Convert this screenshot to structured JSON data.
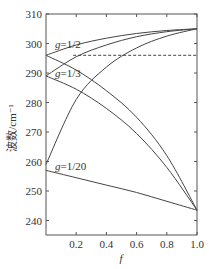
{
  "chart_data": {
    "type": "line",
    "title": "",
    "xlabel": "f",
    "ylabel": "波数/cm⁻¹",
    "xlim": [
      0,
      1.0
    ],
    "ylim": [
      234,
      310
    ],
    "x_ticks": [
      "0.2",
      "0.4",
      "0.6",
      "0.8",
      "1.0"
    ],
    "y_ticks": [
      "240",
      "250",
      "260",
      "270",
      "280",
      "290",
      "300",
      "310"
    ],
    "grid": false,
    "legend": "none",
    "annotations": [
      "g=1/2",
      "g=1/3",
      "g=1/20"
    ],
    "reference_line": {
      "style": "dashed",
      "y": 296,
      "x_range": [
        0.18,
        1.0
      ]
    },
    "x": [
      0,
      0.2,
      0.4,
      0.6,
      0.8,
      1.0
    ],
    "series": [
      {
        "name": "g=1/2 upper",
        "values": [
          296,
          299.5,
          301.8,
          303.4,
          304.4,
          305
        ]
      },
      {
        "name": "g=1/2 lower",
        "values": [
          296,
          291,
          284,
          275,
          262,
          243.5
        ]
      },
      {
        "name": "g=1/3 upper",
        "values": [
          289,
          295.5,
          299.5,
          302.3,
          304,
          305
        ]
      },
      {
        "name": "g=1/3 lower",
        "values": [
          289,
          284.5,
          278,
          269.5,
          258,
          243.5
        ]
      },
      {
        "name": "g=1/20 upper",
        "values": [
          259,
          281,
          292,
          298.5,
          302.5,
          305
        ]
      },
      {
        "name": "g=1/20 lower",
        "values": [
          257,
          254.5,
          252,
          249.5,
          246.5,
          243.5
        ]
      }
    ]
  }
}
